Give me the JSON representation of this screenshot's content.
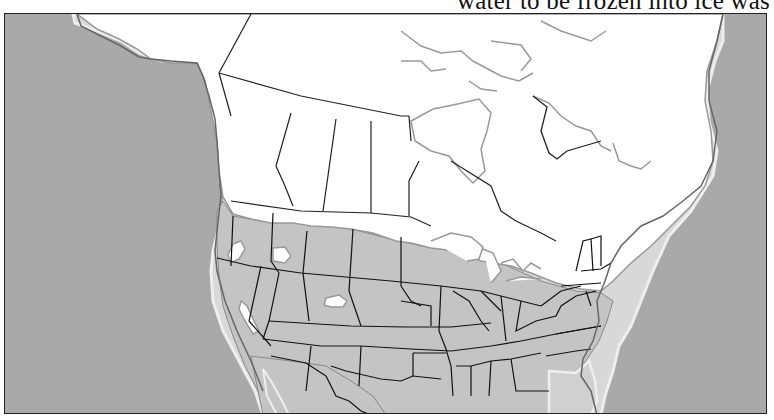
{
  "caption": {
    "text": "water to be frozen into ice was",
    "note": "partially cut off text line at top of page"
  },
  "map": {
    "title": "North America outline map (ice-age coastline)",
    "region": "North America",
    "colors": {
      "ocean": "#a9a9a9",
      "unglaciated_land": "#c4c4c4",
      "ice_covered_land": "#ffffff",
      "ancient_coastline": "#e6e6e6",
      "modern_coastline": "#8a8a8a",
      "borders": "#1a1a1a"
    },
    "legend": []
  }
}
